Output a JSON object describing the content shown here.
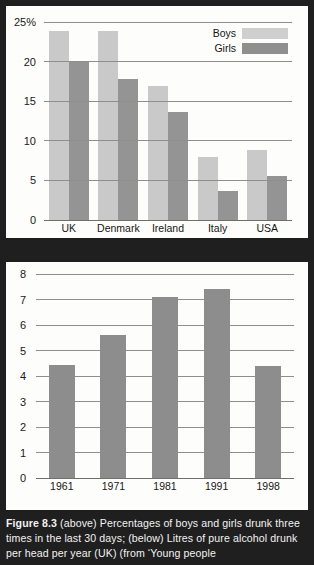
{
  "figure": {
    "caption_label": "Figure 8.3",
    "caption_text": " (above)  Percentages of boys and girls drunk three times in the last 30 days; (below) Litres of pure alcohol drunk per head per year (UK) (from ‘Young people"
  },
  "colors": {
    "boys": "#c9c9c9",
    "girls": "#949494",
    "single_series": "#8d8d8d",
    "panel_background": "#fdfdfb",
    "page_background": "#1f1f1f",
    "gridline": "#8e8e8e",
    "caption_text": "#f2f2f2"
  },
  "chart_data": [
    {
      "type": "bar",
      "title": "",
      "xlabel": "",
      "ylabel": "",
      "ylim": [
        0,
        25
      ],
      "yticks": [
        0,
        5,
        10,
        15,
        20,
        25
      ],
      "ytick_labels": [
        "0",
        "5",
        "10",
        "15",
        "20",
        "25%"
      ],
      "grid": true,
      "legend_position": "top-right",
      "categories": [
        "UK",
        "Denmark",
        "Ireland",
        "Italy",
        "USA"
      ],
      "series": [
        {
          "name": "Boys",
          "values": [
            23.9,
            23.9,
            16.9,
            7.9,
            8.8
          ]
        },
        {
          "name": "Girls",
          "values": [
            20.0,
            17.8,
            13.7,
            3.7,
            5.6
          ]
        }
      ]
    },
    {
      "type": "bar",
      "title": "",
      "xlabel": "",
      "ylabel": "",
      "ylim": [
        0,
        8
      ],
      "yticks": [
        0,
        1,
        2,
        3,
        4,
        5,
        6,
        7,
        8
      ],
      "ytick_labels": [
        "0",
        "1",
        "2",
        "3",
        "4",
        "5",
        "6",
        "7",
        "8"
      ],
      "grid": true,
      "legend_position": "none",
      "categories": [
        "1961",
        "1971",
        "1981",
        "1991",
        "1998"
      ],
      "series": [
        {
          "name": "Litres of pure alcohol per head per year",
          "values": [
            4.45,
            5.6,
            7.1,
            7.4,
            4.4
          ]
        }
      ]
    }
  ]
}
